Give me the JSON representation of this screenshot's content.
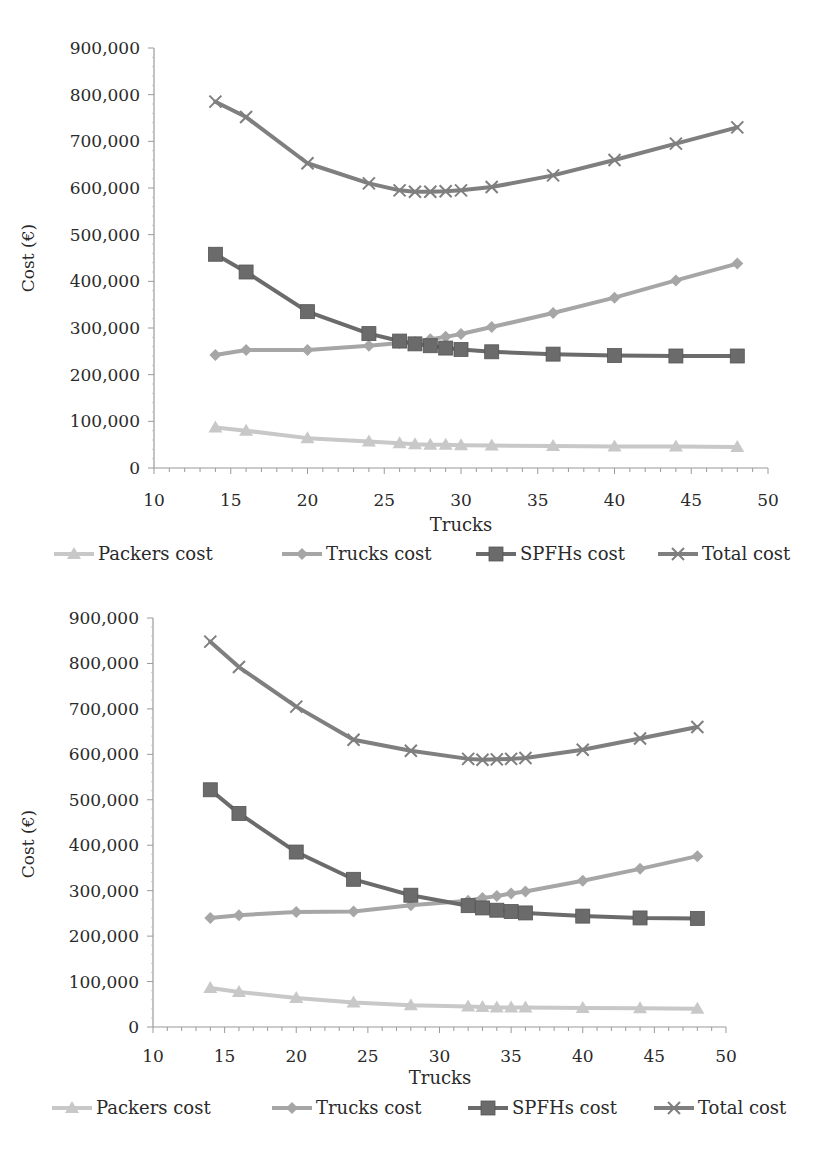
{
  "chart_data": [
    {
      "type": "line",
      "title": "",
      "xlabel": "Trucks",
      "ylabel": "Cost (€)",
      "xlim": [
        10,
        50
      ],
      "ylim": [
        0,
        900000
      ],
      "x_ticks": [
        "10",
        "15",
        "20",
        "25",
        "30",
        "35",
        "40",
        "45",
        "50"
      ],
      "y_ticks": [
        "0",
        "100,000",
        "200,000",
        "300,000",
        "400,000",
        "500,000",
        "600,000",
        "700,000",
        "800,000",
        "900,000"
      ],
      "grid": false,
      "legend_position": "bottom",
      "x": [
        14,
        16,
        20,
        24,
        26,
        27,
        28,
        29,
        30,
        32,
        36,
        40,
        44,
        48
      ],
      "series": [
        {
          "name": "Packers cost",
          "marker": "triangle",
          "color": "#c8c8c8",
          "values": [
            87000,
            80000,
            64000,
            57000,
            53000,
            51000,
            50000,
            50000,
            49000,
            48000,
            47000,
            46000,
            46000,
            45000
          ]
        },
        {
          "name": "Trucks cost",
          "marker": "diamond",
          "color": "#a6a6a6",
          "values": [
            242000,
            253000,
            253000,
            262000,
            268000,
            270000,
            276000,
            281000,
            287000,
            302000,
            332000,
            365000,
            402000,
            438000
          ]
        },
        {
          "name": "SPFHs cost",
          "marker": "square",
          "color": "#6b6b6b",
          "values": [
            458000,
            420000,
            335000,
            288000,
            272000,
            266000,
            262000,
            257000,
            254000,
            249000,
            244000,
            241000,
            240000,
            240000
          ]
        },
        {
          "name": "Total cost",
          "marker": "x",
          "color": "#7f7f7f",
          "values": [
            785000,
            752000,
            653000,
            610000,
            595000,
            592000,
            592000,
            593000,
            595000,
            602000,
            627000,
            660000,
            695000,
            730000
          ]
        }
      ]
    },
    {
      "type": "line",
      "title": "",
      "xlabel": "Trucks",
      "ylabel": "Cost (€)",
      "xlim": [
        10,
        50
      ],
      "ylim": [
        0,
        900000
      ],
      "x_ticks": [
        "10",
        "15",
        "20",
        "25",
        "30",
        "35",
        "40",
        "45",
        "50"
      ],
      "y_ticks": [
        "0",
        "100,000",
        "200,000",
        "300,000",
        "400,000",
        "500,000",
        "600,000",
        "700,000",
        "800,000",
        "900,000"
      ],
      "grid": false,
      "legend_position": "bottom",
      "x": [
        14,
        16,
        20,
        24,
        28,
        32,
        33,
        34,
        35,
        36,
        40,
        44,
        48
      ],
      "series": [
        {
          "name": "Packers cost",
          "marker": "triangle",
          "color": "#c8c8c8",
          "values": [
            86000,
            77000,
            64000,
            54000,
            48000,
            45000,
            44000,
            43000,
            43000,
            43000,
            42000,
            41000,
            40000
          ]
        },
        {
          "name": "Trucks cost",
          "marker": "diamond",
          "color": "#a6a6a6",
          "values": [
            240000,
            246000,
            253000,
            254000,
            268000,
            278000,
            284000,
            288000,
            294000,
            298000,
            322000,
            348000,
            376000
          ]
        },
        {
          "name": "SPFHs cost",
          "marker": "square",
          "color": "#6b6b6b",
          "values": [
            522000,
            470000,
            385000,
            325000,
            290000,
            267000,
            262000,
            257000,
            254000,
            251000,
            244000,
            240000,
            239000
          ]
        },
        {
          "name": "Total cost",
          "marker": "x",
          "color": "#7f7f7f",
          "values": [
            848000,
            792000,
            705000,
            632000,
            608000,
            590000,
            588000,
            589000,
            590000,
            592000,
            610000,
            635000,
            660000
          ]
        }
      ]
    }
  ],
  "charts": [
    {
      "xlabel": "Trucks",
      "ylabel": "Cost (€)",
      "legend": [
        "Packers cost",
        "Trucks cost",
        "SPFHs cost",
        "Total cost"
      ]
    },
    {
      "xlabel": "Trucks",
      "ylabel": "Cost (€)",
      "legend": [
        "Packers cost",
        "Trucks cost",
        "SPFHs cost",
        "Total cost"
      ]
    }
  ]
}
